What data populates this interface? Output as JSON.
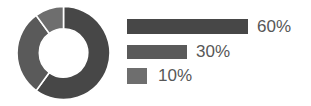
{
  "chart_data": {
    "type": "pie",
    "variant": "donut",
    "title": "",
    "subtitle": "",
    "xlabel": "",
    "ylabel": "",
    "grid": false,
    "legend_position": "right",
    "categories": [
      "60%",
      "30%",
      "10%"
    ],
    "values": [
      60,
      30,
      10
    ],
    "labels": [
      "60%",
      "30%",
      "10%"
    ],
    "colors": [
      "#474747",
      "#5a5a5a",
      "#6e6e6e"
    ],
    "slice_gap_color": "#ffffff",
    "inner_radius_ratio": 0.52,
    "start_angle_deg": 0,
    "direction": "clockwise",
    "slices": [
      {
        "label": "60%",
        "value": 60,
        "color": "#474747",
        "start_deg": 0,
        "end_deg": 216
      },
      {
        "label": "30%",
        "value": 30,
        "color": "#5a5a5a",
        "start_deg": 216,
        "end_deg": 324
      },
      {
        "label": "10%",
        "value": 10,
        "color": "#6e6e6e",
        "start_deg": 324,
        "end_deg": 360
      }
    ]
  },
  "legend": {
    "items": [
      {
        "label": "60%",
        "value": 60,
        "color": "#474747",
        "bar_width_px": 121
      },
      {
        "label": "30%",
        "value": 30,
        "color": "#5a5a5a",
        "bar_width_px": 60
      },
      {
        "label": "10%",
        "value": 10,
        "color": "#6e6e6e",
        "bar_width_px": 20
      }
    ]
  },
  "colors": {
    "background": "#ffffff",
    "text": "#575757",
    "series_1": "#474747",
    "series_2": "#5a5a5a",
    "series_3": "#6e6e6e"
  }
}
